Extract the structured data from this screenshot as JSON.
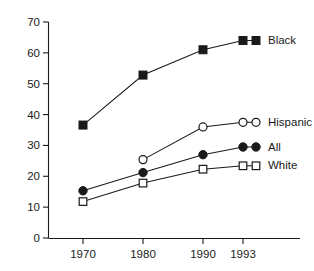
{
  "chart_data": {
    "type": "line",
    "title": "",
    "subtitle": "",
    "xlabel": "",
    "ylabel": "",
    "x": [
      1970,
      1980,
      1990,
      1993
    ],
    "categories": [
      "1970",
      "1980",
      "1990",
      "1993"
    ],
    "xlim": [
      1966,
      1996
    ],
    "ylim": [
      0,
      70
    ],
    "yticks": [
      0,
      10,
      20,
      30,
      40,
      50,
      60,
      70
    ],
    "ytick_labels": [
      "0",
      "10",
      "20",
      "30",
      "40",
      "50",
      "60",
      "70"
    ],
    "xtick_labels": [
      "1970",
      "1980",
      "1990",
      "1993"
    ],
    "grid": false,
    "legend_position": "right-inline-labels",
    "series": [
      {
        "name": "Black",
        "marker": "filled-square",
        "color": "#1a1a1a",
        "x": [
          1970,
          1980,
          1990,
          1993
        ],
        "values": [
          36.6,
          52.8,
          61.0,
          64.0
        ],
        "label": "Black"
      },
      {
        "name": "Hispanic",
        "marker": "open-circle",
        "color": "#1a1a1a",
        "x": [
          1980,
          1990,
          1993
        ],
        "values": [
          25.4,
          36.0,
          37.5
        ],
        "label": "Hispanic"
      },
      {
        "name": "All",
        "marker": "filled-circle",
        "color": "#1a1a1a",
        "x": [
          1970,
          1980,
          1990,
          1993
        ],
        "values": [
          15.3,
          21.2,
          27.0,
          29.5
        ],
        "label": "All"
      },
      {
        "name": "White",
        "marker": "open-square",
        "color": "#1a1a1a",
        "x": [
          1970,
          1980,
          1990,
          1993
        ],
        "values": [
          11.8,
          17.8,
          22.3,
          23.4
        ],
        "label": "White"
      }
    ],
    "annotations": []
  },
  "axes": {
    "y_tick_labels": [
      "70",
      "60",
      "50",
      "40",
      "30",
      "20",
      "10",
      "0"
    ],
    "x_tick_labels": [
      "1970",
      "1980",
      "1990",
      "1993"
    ]
  },
  "labels": {
    "black": "Black",
    "hispanic": "Hispanic",
    "all": "All",
    "white": "White"
  },
  "colors": {
    "ink": "#1a1a1a",
    "background": "#ffffff",
    "marker_fill_open": "#ffffff"
  }
}
